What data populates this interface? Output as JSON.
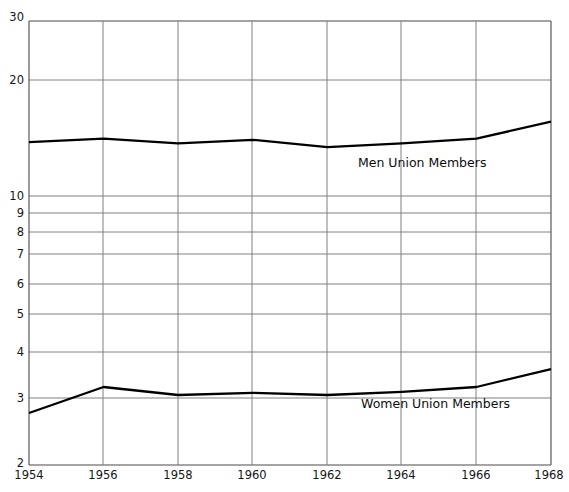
{
  "chart_data": {
    "type": "line",
    "title": "",
    "subtitle": "",
    "xlabel": "",
    "ylabel": "",
    "yscale": "log",
    "ylim": [
      2,
      30
    ],
    "grid": true,
    "legend_position": "inline-right-of-series",
    "x": [
      1954,
      1956,
      1958,
      1960,
      1962,
      1964,
      1966,
      1968
    ],
    "xtick_labels": [
      "1954",
      "1956",
      "1958",
      "1960",
      "1962",
      "1964",
      "1966",
      "1968"
    ],
    "ytick_labels": [
      "30",
      "20",
      "10",
      "9",
      "8",
      "7",
      "6",
      "5",
      "4",
      "3",
      "2"
    ],
    "ytick_values": [
      30,
      20,
      10,
      9,
      8,
      7,
      6,
      5,
      4,
      3,
      2
    ],
    "series": [
      {
        "name": "Men Union Members",
        "values": [
          13.8,
          14.1,
          13.7,
          14.0,
          13.4,
          13.7,
          14.1,
          15.6
        ],
        "color": "#000000"
      },
      {
        "name": "Women Union Members",
        "values": [
          2.73,
          3.19,
          3.04,
          3.08,
          3.04,
          3.1,
          3.19,
          3.55
        ],
        "color": "#000000"
      }
    ],
    "annotations": [
      {
        "text": "Men Union Members",
        "x_px": 358,
        "y_px": 156
      },
      {
        "text": "Women Union Members",
        "x_px": 361,
        "y_px": 397
      }
    ]
  },
  "axes": {
    "left_px": 29,
    "right_px": 551,
    "top_px": 21,
    "bottom_px": 465,
    "axis_color": "#3a3a3a",
    "grid_color": "#7b7b7b"
  }
}
